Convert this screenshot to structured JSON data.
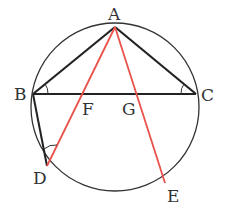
{
  "diagram": {
    "type": "geometry-circle-inscribed-triangle",
    "colors": {
      "black_line": "#222222",
      "red_line": "#e8524a",
      "circle": "#333333",
      "label": "#333333"
    },
    "circle": {
      "cx": 115,
      "cy": 107,
      "r": 84
    },
    "points": {
      "A": {
        "label": "A",
        "x": 115,
        "y": 27
      },
      "B": {
        "label": "B",
        "x": 33,
        "y": 94
      },
      "C": {
        "label": "C",
        "x": 196,
        "y": 94
      },
      "D": {
        "label": "D",
        "x": 47,
        "y": 166
      },
      "E": {
        "label": "E",
        "x": 165,
        "y": 183
      },
      "F": {
        "label": "F",
        "x": 80,
        "y": 94
      },
      "G": {
        "label": "G",
        "x": 138,
        "y": 94
      }
    },
    "segments_black": [
      "AB",
      "AC",
      "BC",
      "BD"
    ],
    "segments_red": [
      "AD",
      "AE"
    ],
    "angle_marks": [
      "ABC",
      "ACB",
      "BDA"
    ]
  }
}
